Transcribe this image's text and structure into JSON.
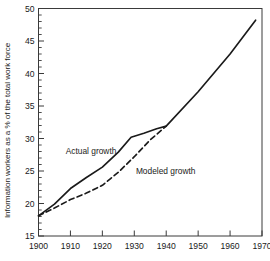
{
  "chart_data": {
    "type": "line",
    "title": "",
    "subtitle": "",
    "xlabel": "",
    "ylabel": "Information workers as a % of the total work force",
    "xlim": [
      1900,
      1970
    ],
    "ylim": [
      15,
      50
    ],
    "xticks": [
      1900,
      1910,
      1920,
      1930,
      1940,
      1950,
      1960,
      1970
    ],
    "xtick_labels": [
      "1900",
      "1910",
      "1920",
      "1930",
      "1940",
      "1950",
      "1960",
      "1970"
    ],
    "yticks": [
      15,
      20,
      25,
      30,
      35,
      40,
      45,
      50
    ],
    "ytick_labels": [
      "15",
      "20",
      "25",
      "30",
      "35",
      "40",
      "45",
      "50"
    ],
    "y_minor_ticks": [
      16,
      17,
      18,
      19,
      21,
      22,
      23,
      24,
      26,
      27,
      28,
      29,
      31,
      32,
      33,
      34,
      36,
      37,
      38,
      39,
      41,
      42,
      43,
      44,
      46,
      47,
      48,
      49
    ],
    "x_minor_ticks": [],
    "grid": false,
    "legend_position": "inline-annotations",
    "series": [
      {
        "name": "Actual growth",
        "style": "solid",
        "color": "#1a1a1a",
        "annotation": "Actual growth",
        "annotation_at": [
          1908.5,
          27.6
        ],
        "x": [
          1900,
          1905,
          1910,
          1915,
          1920,
          1925,
          1929,
          1933,
          1937,
          1940,
          1950,
          1960,
          1968
        ],
        "y": [
          18.1,
          19.9,
          22.3,
          24.0,
          25.6,
          27.9,
          30.2,
          30.8,
          31.5,
          31.9,
          37.2,
          43.0,
          48.2
        ]
      },
      {
        "name": "Modeled growth",
        "style": "dashed",
        "color": "#1a1a1a",
        "annotation": "Modeled growth",
        "annotation_at": [
          1930.5,
          24.6
        ],
        "x": [
          1900,
          1905,
          1910,
          1915,
          1920,
          1925,
          1930,
          1935,
          1940
        ],
        "y": [
          18.1,
          19.3,
          20.6,
          21.6,
          22.8,
          24.8,
          27.2,
          29.8,
          31.9
        ]
      }
    ]
  }
}
